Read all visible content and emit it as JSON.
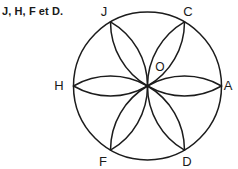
{
  "figure": {
    "caption": "J, H, F et D.",
    "caption_clipped_above": "",
    "background_color": "#ffffff",
    "stroke_color": "#1c1c1c",
    "text_color": "#1a1a1a",
    "type": "six-petal-rosette-in-circle",
    "circle": {
      "center_x": 147.5,
      "center_y": 86,
      "radius": 74
    },
    "center_point": {
      "name": "O",
      "label": "O",
      "label_x": 160,
      "label_y": 71
    },
    "vertices": [
      {
        "name": "A",
        "label": "A",
        "angle_deg": 0,
        "x": 221.5,
        "y": 86,
        "label_x": 228,
        "label_y": 90
      },
      {
        "name": "C",
        "label": "C",
        "angle_deg": 300,
        "x": 184.5,
        "y": 21.9,
        "label_x": 188,
        "label_y": 16
      },
      {
        "name": "J",
        "label": "J",
        "angle_deg": 240,
        "x": 110.5,
        "y": 21.9,
        "label_x": 104,
        "label_y": 16
      },
      {
        "name": "H",
        "label": "H",
        "angle_deg": 180,
        "x": 73.5,
        "y": 86,
        "label_x": 59,
        "label_y": 90
      },
      {
        "name": "F",
        "label": "F",
        "angle_deg": 120,
        "x": 110.5,
        "y": 150.1,
        "label_x": 103,
        "label_y": 166
      },
      {
        "name": "D",
        "label": "D",
        "angle_deg": 60,
        "x": 184.5,
        "y": 150.1,
        "label_x": 187,
        "label_y": 166
      }
    ],
    "petal_count": 6,
    "arc_radius": 74
  }
}
